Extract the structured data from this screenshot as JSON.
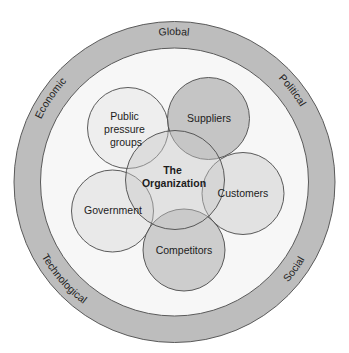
{
  "diagram": {
    "type": "nested-venn",
    "colors": {
      "background": "#ffffff",
      "outer_ring_fill": "#bdbdbd",
      "outer_ring_stroke": "#5a5a5a",
      "inner_area_fill": "#f7f7f7",
      "stroke": "#4a4a4a",
      "light_circle_fill": "#ececec",
      "dark_circle_fill": "#c4c4c4",
      "organization_fill": "#d6d6d6"
    },
    "outer_ring": {
      "labels": {
        "top": "Global",
        "upper_left": "Economic",
        "upper_right": "Political",
        "lower_left": "Technological",
        "lower_right": "Social"
      }
    },
    "center": {
      "line1": "The",
      "line2": "Organization"
    },
    "stakeholders": {
      "public_pressure_groups": {
        "line1": "Public",
        "line2": "pressure",
        "line3": "groups"
      },
      "suppliers": {
        "label": "Suppliers"
      },
      "customers": {
        "label": "Customers"
      },
      "government": {
        "label": "Government"
      },
      "competitors": {
        "label": "Competitors"
      }
    }
  }
}
